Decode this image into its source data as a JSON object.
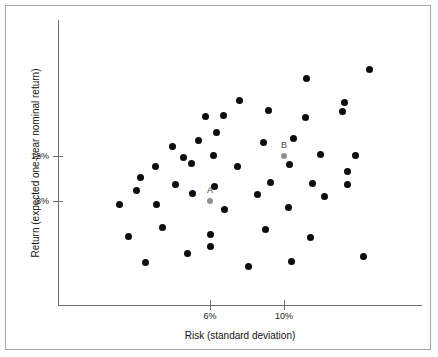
{
  "chart_data": {
    "type": "scatter",
    "title": "",
    "xlabel": "Risk (standard deviation)",
    "ylabel": "Return (expected one-year nominal return)",
    "xticks": [
      {
        "value": 6,
        "label": "6%",
        "px": 210
      },
      {
        "value": 10,
        "label": "10%",
        "px": 284
      }
    ],
    "yticks": [
      {
        "value": 12,
        "label": "12%",
        "px": 156
      },
      {
        "value": 8,
        "label": "8%",
        "px": 201
      }
    ],
    "xlim": [
      2.8,
      17.5
    ],
    "ylim": [
      3.2,
      19.5
    ],
    "grid": false,
    "legend": null,
    "marker_color": "#0d0d0d",
    "highlight_color": "#8e8e8e",
    "points": [
      {
        "x": 7.6,
        "y": 14.1,
        "px": 216,
        "py": 132
      },
      {
        "x": 8.0,
        "y": 15.6,
        "px": 223,
        "py": 115
      },
      {
        "x": 8.9,
        "y": 17.0,
        "px": 239,
        "py": 100
      },
      {
        "x": 10.4,
        "y": 16.1,
        "px": 268,
        "py": 110
      },
      {
        "x": 6.8,
        "y": 15.6,
        "px": 205,
        "py": 116
      },
      {
        "x": 12.4,
        "y": 19.0,
        "px": 306,
        "py": 78
      },
      {
        "x": 12.4,
        "y": 15.5,
        "px": 305,
        "py": 117
      },
      {
        "x": 14.4,
        "y": 16.0,
        "px": 342,
        "py": 111
      },
      {
        "x": 15.9,
        "y": 19.7,
        "px": 369,
        "py": 69
      },
      {
        "x": 14.5,
        "y": 16.8,
        "px": 344,
        "py": 102
      },
      {
        "x": 6.4,
        "y": 13.4,
        "px": 198,
        "py": 140
      },
      {
        "x": 5.0,
        "y": 12.9,
        "px": 172,
        "py": 146
      },
      {
        "x": 5.6,
        "y": 11.9,
        "px": 183,
        "py": 157
      },
      {
        "x": 7.4,
        "y": 12.1,
        "px": 213,
        "py": 155
      },
      {
        "x": 10.1,
        "y": 13.2,
        "px": 263,
        "py": 142
      },
      {
        "x": 11.7,
        "y": 13.6,
        "px": 293,
        "py": 138
      },
      {
        "x": 13.2,
        "y": 12.2,
        "px": 320,
        "py": 154
      },
      {
        "x": 15.1,
        "y": 12.1,
        "px": 355,
        "py": 155
      },
      {
        "x": 4.1,
        "y": 11.0,
        "px": 155,
        "py": 166
      },
      {
        "x": 6.0,
        "y": 11.3,
        "px": 191,
        "py": 163
      },
      {
        "x": 8.8,
        "y": 11.0,
        "px": 237,
        "py": 166
      },
      {
        "x": 11.5,
        "y": 11.2,
        "px": 289,
        "py": 164
      },
      {
        "x": 14.5,
        "y": 10.6,
        "px": 347,
        "py": 171
      },
      {
        "x": 3.3,
        "y": 10.0,
        "px": 140,
        "py": 177
      },
      {
        "x": 5.2,
        "y": 9.4,
        "px": 175,
        "py": 184
      },
      {
        "x": 7.5,
        "y": 9.2,
        "px": 214,
        "py": 186
      },
      {
        "x": 10.6,
        "y": 9.6,
        "px": 270,
        "py": 182
      },
      {
        "x": 12.8,
        "y": 9.5,
        "px": 312,
        "py": 183
      },
      {
        "x": 14.5,
        "y": 9.3,
        "px": 347,
        "py": 184
      },
      {
        "x": 3.0,
        "y": 8.5,
        "px": 136,
        "py": 190
      },
      {
        "x": 6.1,
        "y": 8.3,
        "px": 192,
        "py": 193
      },
      {
        "x": 9.7,
        "y": 8.2,
        "px": 257,
        "py": 194
      },
      {
        "x": 13.4,
        "y": 8.0,
        "px": 324,
        "py": 196
      },
      {
        "x": 1.8,
        "y": 7.7,
        "px": 119,
        "py": 204
      },
      {
        "x": 4.0,
        "y": 7.6,
        "px": 156,
        "py": 204
      },
      {
        "x": 8.0,
        "y": 7.3,
        "px": 224,
        "py": 209
      },
      {
        "x": 11.4,
        "y": 7.4,
        "px": 288,
        "py": 207
      },
      {
        "x": 2.3,
        "y": 6.2,
        "px": 128,
        "py": 236
      },
      {
        "x": 4.5,
        "y": 6.9,
        "px": 162,
        "py": 227
      },
      {
        "x": 7.2,
        "y": 6.4,
        "px": 210,
        "py": 234
      },
      {
        "x": 10.2,
        "y": 6.8,
        "px": 265,
        "py": 229
      },
      {
        "x": 12.7,
        "y": 6.1,
        "px": 310,
        "py": 237
      },
      {
        "x": 3.3,
        "y": 5.2,
        "px": 145,
        "py": 262
      },
      {
        "x": 5.6,
        "y": 5.4,
        "px": 187,
        "py": 253
      },
      {
        "x": 6.8,
        "y": 6.0,
        "px": 210,
        "py": 246
      },
      {
        "x": 8.9,
        "y": 4.2,
        "px": 248,
        "py": 266
      },
      {
        "x": 11.2,
        "y": 4.6,
        "px": 291,
        "py": 261
      },
      {
        "x": 15.0,
        "y": 4.9,
        "px": 363,
        "py": 256
      }
    ],
    "highlighted_points": [
      {
        "label": "A",
        "x": 6.0,
        "y": 8.0,
        "px": 210,
        "py": 201
      },
      {
        "label": "B",
        "x": 10.0,
        "y": 12.0,
        "px": 284,
        "py": 156
      }
    ]
  }
}
